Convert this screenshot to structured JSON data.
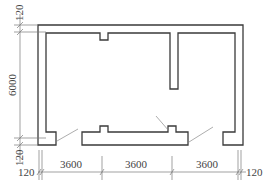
{
  "diagram": {
    "type": "architectural-floor-plan",
    "line_color": "#3a3a3a",
    "dimension_color": "#7a7a7a",
    "dimensions": {
      "left": {
        "top_wall": "120",
        "height": "6000",
        "bottom_wall": "120"
      },
      "bottom": {
        "left_wall": "120",
        "bays": [
          "3600",
          "3600",
          "3600"
        ],
        "right_wall": "120"
      }
    }
  }
}
